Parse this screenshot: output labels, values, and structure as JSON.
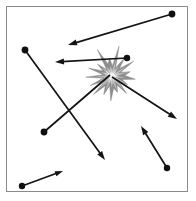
{
  "figure": {
    "type": "vector-diagram",
    "canvas": {
      "width": 196,
      "height": 201,
      "background": "#ffffff"
    },
    "frame": {
      "x": 6,
      "y": 6,
      "width": 182,
      "height": 186,
      "stroke": "#8a8a8a",
      "stroke_width": 1
    },
    "colors": {
      "line": "#141414",
      "dot": "#101010",
      "burst_outer": "#8d8d8d",
      "burst_mid": "#b9b9b9",
      "burst_core": "#f2f2f2",
      "frame": "#8a8a8a",
      "background": "#ffffff"
    }
  },
  "burst": {
    "name": "impact-starburst",
    "center": {
      "x": 112,
      "y": 76
    },
    "radius_outer": 26,
    "radius_inner": 11,
    "points": 17,
    "rotation_deg": 8
  },
  "vectors": [
    {
      "id": "vector-1",
      "label": "top-incoming-arrow",
      "start": {
        "x": 172,
        "y": 14
      },
      "end": {
        "x": 68,
        "y": 45
      },
      "has_start_dot": true,
      "has_arrowhead": true,
      "dot_radius": 3.4,
      "head_length": 9,
      "head_width": 6
    },
    {
      "id": "vector-2",
      "label": "upper-left-to-lower-right-arrow",
      "start": {
        "x": 25,
        "y": 50
      },
      "end": {
        "x": 105,
        "y": 160
      },
      "has_start_dot": true,
      "has_arrowhead": true,
      "dot_radius": 3.4,
      "head_length": 9,
      "head_width": 6
    },
    {
      "id": "vector-3",
      "label": "lower-left-to-burst-arrow",
      "start": {
        "x": 44,
        "y": 132
      },
      "end": {
        "x": 110,
        "y": 75
      },
      "has_start_dot": true,
      "has_arrowhead": false,
      "dot_radius": 3.4,
      "head_length": 0,
      "head_width": 0
    },
    {
      "id": "vector-4",
      "label": "burst-to-left-arrow",
      "start": {
        "x": 127,
        "y": 58
      },
      "end": {
        "x": 55,
        "y": 62
      },
      "has_start_dot": true,
      "has_arrowhead": true,
      "dot_radius": 3.2,
      "head_length": 9,
      "head_width": 6
    },
    {
      "id": "vector-5",
      "label": "burst-to-lower-right-arrow",
      "start": {
        "x": 112,
        "y": 77
      },
      "end": {
        "x": 177,
        "y": 119
      },
      "has_start_dot": false,
      "has_arrowhead": true,
      "dot_radius": 0,
      "head_length": 9,
      "head_width": 6
    },
    {
      "id": "vector-6",
      "label": "lower-right-upward-arrow",
      "start": {
        "x": 167,
        "y": 168
      },
      "end": {
        "x": 141,
        "y": 126
      },
      "has_start_dot": true,
      "has_arrowhead": true,
      "dot_radius": 3.2,
      "head_length": 9,
      "head_width": 6
    },
    {
      "id": "vector-7",
      "label": "bottom-left-short-arrow",
      "start": {
        "x": 22,
        "y": 186
      },
      "end": {
        "x": 63,
        "y": 171
      },
      "has_start_dot": true,
      "has_arrowhead": true,
      "dot_radius": 3.2,
      "head_length": 8,
      "head_width": 5.5
    }
  ]
}
